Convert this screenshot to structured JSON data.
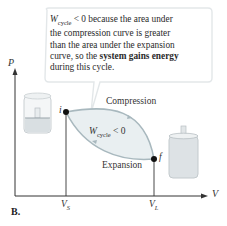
{
  "figure_label": "B.",
  "callout": {
    "w_symbol": "W",
    "w_sub": "cycle",
    "line1_rest": " < 0 because the area under",
    "line2": "the compression curve is greater",
    "line3": "than the area under the expansion",
    "line4_start": "curve, so the ",
    "line4_bold": "system gains energy",
    "line5": "during this cycle."
  },
  "axes": {
    "y_label": "P",
    "x_label": "V",
    "x_ticks": [
      {
        "main": "V",
        "sub": "S"
      },
      {
        "main": "V",
        "sub": "L"
      }
    ]
  },
  "points": {
    "initial": "i",
    "final": "f"
  },
  "curves": {
    "upper": "Compression",
    "lower": "Expansion",
    "inside_w": "W",
    "inside_sub": "cycle",
    "inside_rest": " < 0"
  },
  "colors": {
    "loop_fill": "#e8eef0",
    "loop_stroke": "#a9b9bf",
    "axis": "#333333",
    "callout_border": "#e2e6e8"
  }
}
